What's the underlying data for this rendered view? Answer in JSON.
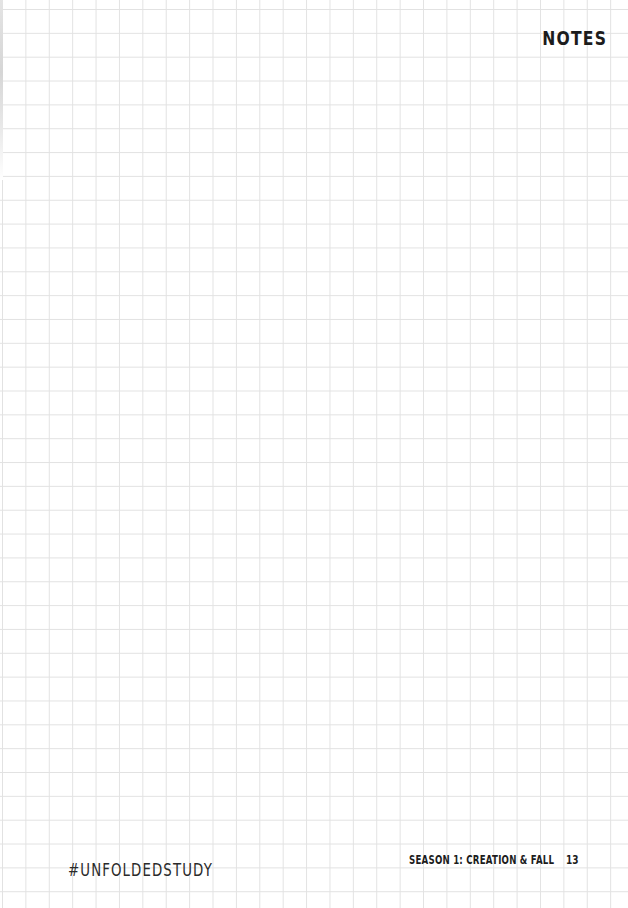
{
  "page": {
    "title": "NOTES",
    "layout": "grid-paper",
    "grid_line_color": "#e2e2e2",
    "background_color": "#ffffff"
  },
  "footer": {
    "hashtag": "#UNFOLDEDSTUDY",
    "season": "SEASON 1: CREATION & FALL",
    "page_number": "13"
  }
}
